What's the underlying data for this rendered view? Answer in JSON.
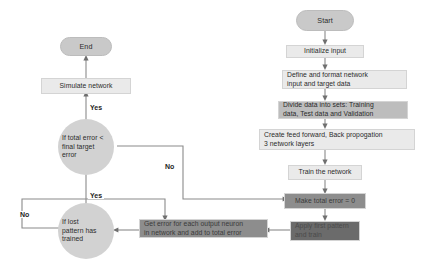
{
  "diagram": {
    "colors": {
      "pill": "#c9c9c9",
      "circle": "#d2d2d2",
      "light_box": "#eaeaea",
      "mid_box": "#bdbdbd",
      "dark_box": "#8d8d8d",
      "darker_box": "#6b6b6b",
      "connector": "#8a8a8a",
      "text": "#2b2b2b"
    },
    "nodes": [
      {
        "id": "start",
        "label": "Start"
      },
      {
        "id": "init",
        "label": "Initialize input"
      },
      {
        "id": "define",
        "label": "Define and format network\ninput and target data"
      },
      {
        "id": "divide",
        "label": "Divide data into sets: Training\ndata, Test data and Validation"
      },
      {
        "id": "create",
        "label": "Create feed forward, Back propogation\n3 network layers"
      },
      {
        "id": "train",
        "label": "Train the network"
      },
      {
        "id": "make_zero",
        "label": "Make total error = 0"
      },
      {
        "id": "apply",
        "label": "Apply first pattern\nand train"
      },
      {
        "id": "get_error",
        "label": "Get error for each output neuron\nin network and add to total error"
      },
      {
        "id": "last_pattern",
        "label": "If lost\npattern has\ntrained"
      },
      {
        "id": "total_error",
        "label": "If total error <\nfinal target\nerror"
      },
      {
        "id": "simulate",
        "label": "Simulate network"
      },
      {
        "id": "end",
        "label": "End"
      }
    ],
    "edge_labels": {
      "yes_simulate": "Yes",
      "yes_last_pattern": "Yes",
      "no_total_error": "No",
      "no_last_pattern": "No"
    }
  }
}
